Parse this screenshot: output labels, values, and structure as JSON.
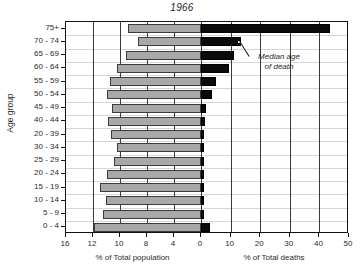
{
  "chart_data": {
    "type": "bar",
    "title": "1966",
    "subtitle": "",
    "orientation": "horizontal",
    "layout": "population-pyramid-back-to-back",
    "ylabel": "Age group",
    "grid": "horizontal-light-vertical-dark",
    "legend": "none",
    "categories": [
      "75+",
      "70 - 74",
      "65 - 69",
      "60 - 64",
      "55 - 59",
      "50 - 54",
      "45 - 49",
      "40 - 44",
      "20 - 39",
      "30 - 34",
      "25 - 29",
      "20 - 24",
      "15 - 19",
      "10 - 14",
      "5 - 9",
      "0 - 4"
    ],
    "left_axis": {
      "label": "% of Total population",
      "ticks": [
        "16",
        "12",
        "10",
        "8",
        "4",
        "0"
      ],
      "range": [
        16,
        0
      ],
      "direction": "right-to-left"
    },
    "right_axis": {
      "label": "% of Total deaths",
      "ticks": [
        "0",
        "10",
        "20",
        "30",
        "40",
        "50"
      ],
      "range": [
        0,
        50
      ],
      "direction": "left-to-right"
    },
    "series": [
      {
        "name": "% of Total population",
        "side": "left",
        "color": "#a8a8a8",
        "values": [
          8.6,
          7.5,
          8.9,
          9.9,
          10.8,
          11.1,
          10.5,
          11.0,
          10.7,
          9.9,
          10.3,
          11.1,
          12.0,
          11.3,
          11.6,
          12.7
        ]
      },
      {
        "name": "% of Total deaths",
        "side": "right",
        "color": "#0b0b0b",
        "values": [
          43.5,
          13.5,
          11.0,
          9.5,
          5.0,
          3.6,
          1.8,
          1.2,
          0.9,
          1.0,
          0.6,
          0.6,
          0.7,
          0.5,
          0.8,
          3.0
        ]
      }
    ],
    "annotation": {
      "text": "Median age\nof death",
      "marker": "white-square",
      "marker_category": "70 - 74",
      "marker_value": 13.0
    }
  }
}
